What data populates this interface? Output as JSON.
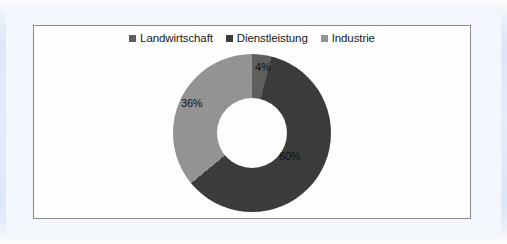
{
  "page": {
    "background_color": "#ffffff",
    "frame_color": "#dde8f8",
    "card_background": "#ffffff",
    "card_border_color": "#8b8b8b"
  },
  "chart_data": {
    "type": "pie",
    "variant": "doughnut",
    "title": "",
    "subtitle": "",
    "xlabel": "",
    "ylabel": "",
    "legend_position": "top",
    "grid": false,
    "start_angle_deg": 0,
    "direction": "clockwise",
    "inner_radius_ratio": 0.44,
    "categories": [
      "Landwirtschaft",
      "Dienstleistung",
      "Industrie"
    ],
    "values": [
      4,
      60,
      36
    ],
    "unit": "%",
    "data_labels": [
      "4%",
      "60%",
      "36%"
    ],
    "colors": [
      "#5f5f5f",
      "#3c3c3c",
      "#949494"
    ],
    "legend": [
      {
        "label": "Landwirtschaft",
        "color": "#5f5f5f",
        "marker": "square-marker"
      },
      {
        "label": "Dienstleistung",
        "color": "#3c3c3c",
        "marker": "square-marker"
      },
      {
        "label": "Industrie",
        "color": "#949494",
        "marker": "square-marker"
      }
    ]
  }
}
